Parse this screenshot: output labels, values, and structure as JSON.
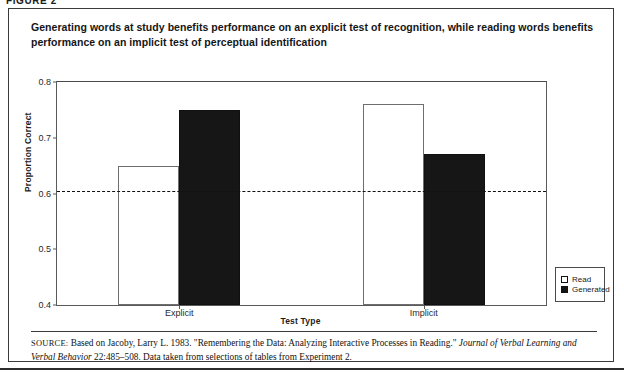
{
  "page": {
    "figure_tag": "FIGURE 2"
  },
  "figure": {
    "title": "Generating words at study benefits performance on an explicit test of recognition, while reading words benefits performance on an implicit test of perceptual identification",
    "source_label": "SOURCE:",
    "source_text_1": "Based on Jacoby, Larry L. 1983. \"Remembering the Data: Analyzing Interactive Processes in Reading.\" ",
    "source_italic_1": "Journal of Verbal Learning and Verbal Behavior",
    "source_text_2": " 22:485–508. Data taken from selections of tables from Experiment 2."
  },
  "chart_data": {
    "type": "bar",
    "title": "",
    "xlabel": "Test Type",
    "ylabel": "Proportion Correct",
    "categories": [
      "Explicit",
      "Implicit"
    ],
    "series": [
      {
        "name": "Read",
        "values": [
          0.65,
          0.76
        ],
        "color": "#ffffff"
      },
      {
        "name": "Generated",
        "values": [
          0.75,
          0.67
        ],
        "color": "#161616"
      }
    ],
    "ylim": [
      0.4,
      0.8
    ],
    "yticks": [
      0.4,
      0.5,
      0.6,
      0.7,
      0.8
    ],
    "ytick_labels": [
      "0.4",
      "0.5",
      "0.6",
      "0.7",
      "0.8"
    ],
    "grid": false,
    "legend_position": "right-bottom-outside",
    "annotations": [
      {
        "type": "reference-line",
        "style": "dashed",
        "value": 0.605,
        "orientation": "horizontal"
      }
    ]
  },
  "legend": {
    "items": [
      {
        "label": "Read",
        "swatch": "open-square"
      },
      {
        "label": "Generated",
        "swatch": "filled-square"
      }
    ]
  }
}
